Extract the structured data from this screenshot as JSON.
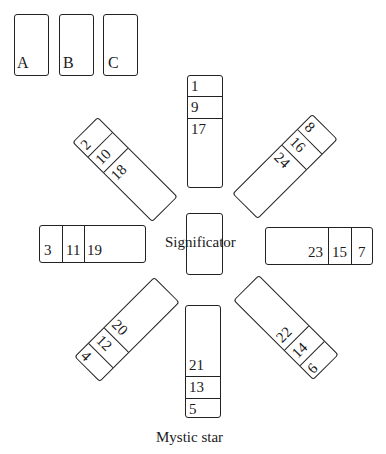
{
  "reserve_cards": [
    {
      "label": "A"
    },
    {
      "label": "B"
    },
    {
      "label": "C"
    }
  ],
  "center": {
    "label": "Significator"
  },
  "stacks": {
    "top": {
      "position": "north",
      "cards": [
        "1",
        "9",
        "17"
      ]
    },
    "top_left": {
      "position": "northwest",
      "cards": [
        "2",
        "10",
        "18"
      ]
    },
    "top_right": {
      "position": "northeast",
      "cards": [
        "8",
        "16",
        "24"
      ]
    },
    "left": {
      "position": "west",
      "cards": [
        "3",
        "11",
        "19"
      ]
    },
    "right": {
      "position": "east",
      "cards": [
        "23",
        "15",
        "7"
      ]
    },
    "bottom_left": {
      "position": "southwest",
      "cards": [
        "4",
        "12",
        "20"
      ]
    },
    "bottom_right": {
      "position": "southeast",
      "cards": [
        "22",
        "14",
        "6"
      ]
    },
    "bottom": {
      "position": "south",
      "cards": [
        "21",
        "13",
        "5"
      ]
    }
  },
  "caption": "Mystic star"
}
